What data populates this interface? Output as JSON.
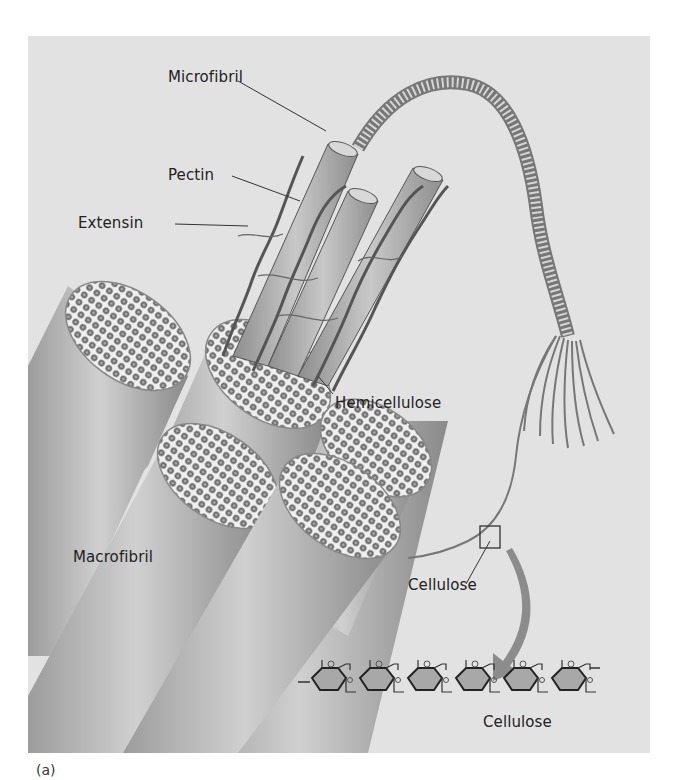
{
  "figure": {
    "caption_marker": "(a)",
    "labels": {
      "microfibril": "Microfibril",
      "pectin": "Pectin",
      "extensin": "Extensin",
      "hemicellulose": "Hemicellulose",
      "macrofibril": "Macrofibril",
      "cellulose_strand": "Cellulose",
      "cellulose_molecule": "Cellulose"
    },
    "glucose_ring_atom": "O",
    "glucose_unit_count": 6,
    "colors": {
      "background": "#e2e2e2",
      "fibril_fill": "#b4b4b4",
      "fibril_dark": "#7a7a7a",
      "strand": "#555555",
      "arrow": "#8c8c8c",
      "ring_fill": "#a8a8a8",
      "text": "#222222"
    }
  }
}
